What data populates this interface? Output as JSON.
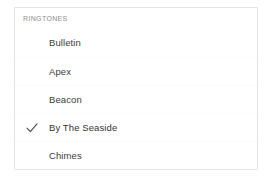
{
  "section": {
    "header": "RINGTONES"
  },
  "list": {
    "selected_value": "By The Seaside",
    "check_icon_name": "checkmark-icon",
    "items": [
      {
        "label": "Bulletin",
        "selected": false
      },
      {
        "label": "Apex",
        "selected": false
      },
      {
        "label": "Beacon",
        "selected": false
      },
      {
        "label": "By The Seaside",
        "selected": true
      },
      {
        "label": "Chimes",
        "selected": false
      }
    ]
  },
  "colors": {
    "card_background": "#ffffff",
    "card_border": "#e3e3e3",
    "row_separator": "#fbfbfb",
    "header_text": "#8d8d8d",
    "label_text": "#3c3c3c",
    "checkmark": "#4a4a4a",
    "page_background": "#ffffff"
  }
}
